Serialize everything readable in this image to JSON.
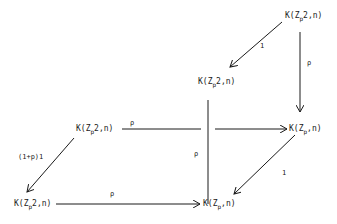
{
  "diagram": {
    "type": "commutative-cube",
    "nodes": [
      {
        "id": "top_right",
        "K": "K(Z",
        "sub": "p",
        "rest": "2,n)"
      },
      {
        "id": "mid_top",
        "K": "K(Z",
        "sub": "p",
        "rest": "2,n)"
      },
      {
        "id": "mid_left",
        "K": "K(Z",
        "sub": "p",
        "rest": "2,n)"
      },
      {
        "id": "mid_right",
        "K": "K(Z",
        "sub": "p",
        "rest": ",n)"
      },
      {
        "id": "bottom_left",
        "K": "K(Z",
        "sub": "p",
        "rest": "2,n)"
      },
      {
        "id": "bottom_mid",
        "K": "K(Z",
        "sub": "p",
        "rest": ",n)"
      }
    ],
    "edges": [
      {
        "from": "top_right",
        "to": "mid_top",
        "label": "1"
      },
      {
        "from": "top_right",
        "to": "mid_right",
        "label": "ρ"
      },
      {
        "from": "mid_top",
        "to": "bottom_mid",
        "label": "ρ"
      },
      {
        "from": "mid_left",
        "to": "mid_right",
        "label": "ρ"
      },
      {
        "from": "mid_left",
        "to": "bottom_left",
        "label": "(1+p)1"
      },
      {
        "from": "bottom_left",
        "to": "bottom_mid",
        "label": "ρ"
      },
      {
        "from": "mid_right",
        "to": "bottom_mid",
        "label": "1"
      }
    ]
  }
}
